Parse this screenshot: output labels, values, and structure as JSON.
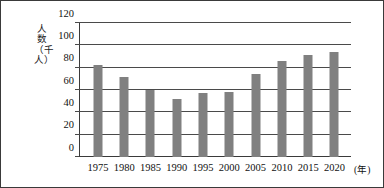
{
  "chart_data": {
    "type": "bar",
    "title": "",
    "subtitle": "",
    "xlabel": "(年)",
    "ylabel": "人数（千人）",
    "categories": [
      "1975",
      "1980",
      "1985",
      "1990",
      "1995",
      "2000",
      "2005",
      "2010",
      "2015",
      "2020"
    ],
    "values": [
      82,
      72,
      60,
      52,
      57,
      58,
      74,
      86,
      91,
      94
    ],
    "ylim": [
      0,
      120
    ],
    "yticks": [
      0,
      20,
      40,
      60,
      80,
      100,
      120
    ],
    "ytick_labels": [
      "0",
      "20",
      "40",
      "60",
      "80",
      "100",
      "120"
    ],
    "grid": true,
    "legend": false,
    "bar_color": "#808080",
    "axis_color": "#3a3a3a",
    "grid_color": "#4a4a4a"
  }
}
